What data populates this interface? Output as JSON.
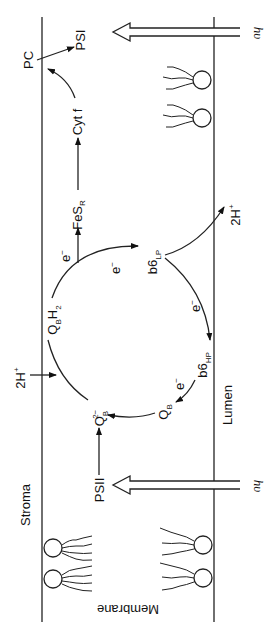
{
  "diagram": {
    "orientation": "rotated 90 degrees clockwise",
    "regions": {
      "stroma": "Stroma",
      "lumen": "Lumen",
      "membrane": "Membrane"
    },
    "light": {
      "symbol": "hυ"
    },
    "nodes": {
      "pc": "PC",
      "psi": "PSI",
      "psii": "PSII",
      "cytf": "Cyt f",
      "fes": "FeS",
      "fes_sub": "R",
      "qbh2_q": "Q",
      "qbh2_b": "B",
      "qbh2_h": "H",
      "qbh2_2": "2",
      "b6lp": "b6",
      "b6lp_sub": "LP",
      "b6hp": "b6",
      "b6hp_sub": "HP",
      "qb": "Q",
      "qb_sub": "B",
      "qb2": "Q",
      "qb2_sub": "B",
      "qb2_sup": "2−"
    },
    "protons": {
      "stroma_in": "2H",
      "lumen_out": "2H",
      "plus": "+"
    },
    "electrons": {
      "e": "e",
      "minus": "−"
    }
  }
}
